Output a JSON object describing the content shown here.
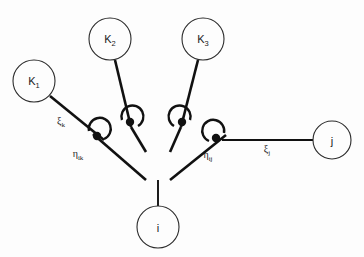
{
  "figure": {
    "background_color": "#fdfdfd",
    "stroke_color": "#111111",
    "node_stroke_color": "#2b2b2b",
    "type": "tree-diagram"
  },
  "nodes": [
    {
      "id": "K1",
      "base": "K",
      "subscript": "1",
      "cx": 34,
      "cy": 81,
      "r": 21
    },
    {
      "id": "K2",
      "base": "K",
      "subscript": "2",
      "cx": 110,
      "cy": 39,
      "r": 21
    },
    {
      "id": "K3",
      "base": "K",
      "subscript": "3",
      "cx": 203,
      "cy": 39,
      "r": 21
    },
    {
      "id": "j",
      "base": "j",
      "subscript": "",
      "cx": 332,
      "cy": 140,
      "r": 19
    },
    {
      "id": "i",
      "base": "i",
      "subscript": "",
      "cx": 158,
      "cy": 227,
      "r": 21
    }
  ],
  "edge_labels": [
    {
      "id": "xi_k",
      "base": "ξ",
      "subscript": "k",
      "x": 61,
      "y": 124
    },
    {
      "id": "eta_ik",
      "base": "η",
      "subscript": "ik",
      "x": 78,
      "y": 157
    },
    {
      "id": "eta_ij",
      "base": "η",
      "subscript": "ij",
      "x": 208,
      "y": 158
    },
    {
      "id": "xi_j",
      "base": "ξ",
      "subscript": "j",
      "x": 267,
      "y": 152
    }
  ],
  "angle_markers": [
    {
      "id": "angle-ik",
      "vertex_x": 97,
      "vertex_y": 138
    },
    {
      "id": "angle-k2",
      "vertex_x": 130,
      "vertex_y": 124
    },
    {
      "id": "angle-k3",
      "vertex_x": 182,
      "vertex_y": 124
    },
    {
      "id": "angle-ij",
      "vertex_x": 216,
      "vertex_y": 141
    }
  ],
  "branches": {
    "k1_to_left": "M 50,96 L 104,140",
    "k2_to_left": "M 115,60 L 131,127",
    "k3_to_right": "M 198,60 L 181,127",
    "j_to_right": "M 313,140 L 222,140",
    "left_arm": "M 93,134 L 146,180",
    "right_arm": "M 226,135 L 170,180",
    "left_upper": "M 124,130 L 146,152",
    "right_upper": "M 188,130 L 170,152",
    "left_cross": "M 131,127 L 146,152",
    "right_cross": "M 181,127 L 170,152",
    "trunk": "M 158,180 L 158,206"
  }
}
